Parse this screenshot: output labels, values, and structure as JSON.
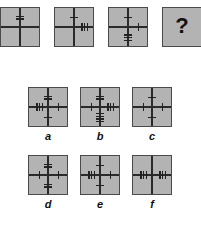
{
  "puzzle": {
    "sequence": [
      {
        "id": "seq-1",
        "top": 2,
        "right": 0,
        "bottom": 0,
        "left": 0
      },
      {
        "id": "seq-2",
        "top": 1,
        "right": 3,
        "bottom": 0,
        "left": 0
      },
      {
        "id": "seq-3",
        "top": 1,
        "right": 1,
        "bottom": 3,
        "left": 0
      },
      {
        "id": "seq-4",
        "question": "?"
      }
    ],
    "options": [
      {
        "label": "a",
        "top": 2,
        "right": 1,
        "bottom": 1,
        "left": 3
      },
      {
        "label": "b",
        "top": 2,
        "right": 3,
        "bottom": 4,
        "left": 1
      },
      {
        "label": "c",
        "top": 1,
        "right": 1,
        "bottom": 1,
        "left": 1
      },
      {
        "label": "d",
        "top": 2,
        "right": 1,
        "bottom": 2,
        "left": 1
      },
      {
        "label": "e",
        "top": 1,
        "right": 1,
        "bottom": 1,
        "left": 3
      },
      {
        "label": "f",
        "top": 0,
        "right": 3,
        "bottom": 0,
        "left": 3
      }
    ]
  },
  "colors": {
    "box_fill": "#b3b3b3",
    "line": "#2a2a2a",
    "background": "#ffffff"
  }
}
